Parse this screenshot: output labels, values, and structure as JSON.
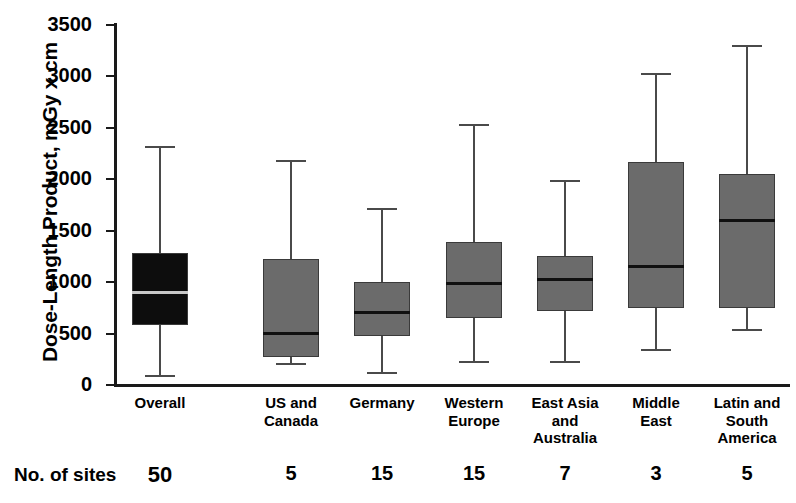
{
  "chart_data": {
    "type": "box",
    "title": "",
    "xlabel": "",
    "ylabel": "Dose-Length Product, mGy x cm",
    "ylim": [
      0,
      3500
    ],
    "yticks": [
      0,
      500,
      1000,
      1500,
      2000,
      2500,
      3000,
      3500
    ],
    "ytick_labels": [
      "0",
      "500",
      "1000",
      "1500",
      "2000",
      "2500",
      "3000",
      "3500"
    ],
    "grid": false,
    "legend": "none",
    "categories": [
      "Overall",
      "US and Canada",
      "Germany",
      "Western Europe",
      "East Asia and Australia",
      "Middle East",
      "Latin and South America"
    ],
    "category_lines": [
      [
        "Overall"
      ],
      [
        "US and",
        "Canada"
      ],
      [
        "Germany"
      ],
      [
        "Western",
        "Europe"
      ],
      [
        "East Asia",
        "and",
        "Australia"
      ],
      [
        "Middle",
        "East"
      ],
      [
        "Latin and",
        "South",
        "America"
      ]
    ],
    "boxes": [
      {
        "name": "Overall",
        "whisker_low": 90,
        "q1": 580,
        "median": 900,
        "q3": 1280,
        "whisker_high": 2310,
        "fill": "#0d0d0d",
        "median_color": "#c8c8c8"
      },
      {
        "name": "US and Canada",
        "whisker_low": 200,
        "q1": 270,
        "median": 510,
        "q3": 1225,
        "whisker_high": 2175,
        "fill": "#6b6b6b",
        "median_color": "#101010"
      },
      {
        "name": "Germany",
        "whisker_low": 115,
        "q1": 480,
        "median": 710,
        "q3": 1000,
        "whisker_high": 1710,
        "fill": "#6b6b6b",
        "median_color": "#101010"
      },
      {
        "name": "Western Europe",
        "whisker_low": 225,
        "q1": 650,
        "median": 990,
        "q3": 1395,
        "whisker_high": 2530,
        "fill": "#6b6b6b",
        "median_color": "#101010"
      },
      {
        "name": "East Asia and Australia",
        "whisker_low": 225,
        "q1": 715,
        "median": 1035,
        "q3": 1255,
        "whisker_high": 1980,
        "fill": "#6b6b6b",
        "median_color": "#101010"
      },
      {
        "name": "Middle East",
        "whisker_low": 345,
        "q1": 750,
        "median": 1160,
        "q3": 2165,
        "whisker_high": 3025,
        "fill": "#6b6b6b",
        "median_color": "#101010"
      },
      {
        "name": "Latin and South America",
        "whisker_low": 530,
        "q1": 745,
        "median": 1605,
        "q3": 2055,
        "whisker_high": 3300,
        "fill": "#6b6b6b",
        "median_color": "#101010"
      }
    ]
  },
  "footer": {
    "label": "No. of sites",
    "counts": [
      "50",
      "5",
      "15",
      "15",
      "7",
      "3",
      "5"
    ]
  },
  "colors": {
    "axis": "#1a1a1a",
    "box_dark": "#0d0d0d",
    "box_gray": "#6b6b6b",
    "whisker": "#4a4a4a",
    "background": "#ffffff"
  }
}
